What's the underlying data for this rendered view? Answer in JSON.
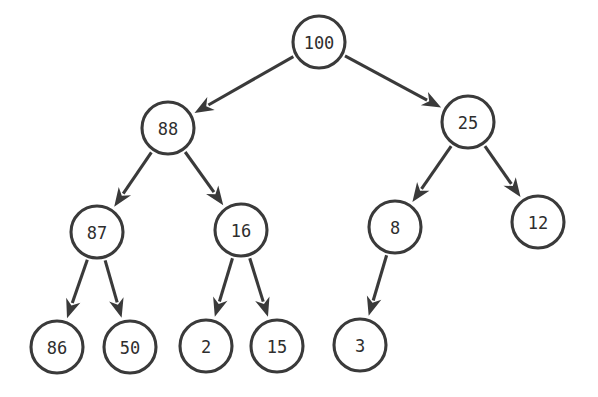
{
  "diagram": {
    "background_color": "#ffffff",
    "stroke_color": "#3a3a3a",
    "text_color": "#2e2e2e",
    "width": 598,
    "height": 397,
    "node_radius": 26,
    "nodes": [
      {
        "id": "n100",
        "label": "100",
        "cx": 319,
        "cy": 42,
        "r": 26
      },
      {
        "id": "n88",
        "label": "88",
        "cx": 168,
        "cy": 128,
        "r": 26
      },
      {
        "id": "n25",
        "label": "25",
        "cx": 468,
        "cy": 122,
        "r": 26
      },
      {
        "id": "n87",
        "label": "87",
        "cx": 97,
        "cy": 232,
        "r": 26
      },
      {
        "id": "n16",
        "label": "16",
        "cx": 241,
        "cy": 230,
        "r": 26
      },
      {
        "id": "n8",
        "label": "8",
        "cx": 395,
        "cy": 227,
        "r": 26
      },
      {
        "id": "n12",
        "label": "12",
        "cx": 538,
        "cy": 222,
        "r": 26
      },
      {
        "id": "n86",
        "label": "86",
        "cx": 57,
        "cy": 347,
        "r": 26
      },
      {
        "id": "n50",
        "label": "50",
        "cx": 130,
        "cy": 347,
        "r": 26
      },
      {
        "id": "n2",
        "label": "2",
        "cx": 206,
        "cy": 346,
        "r": 26
      },
      {
        "id": "n15",
        "label": "15",
        "cx": 277,
        "cy": 346,
        "r": 26
      },
      {
        "id": "n3",
        "label": "3",
        "cx": 360,
        "cy": 345,
        "r": 26
      }
    ],
    "edges": [
      {
        "id": "e-100-88",
        "from": "n100",
        "to": "n88",
        "from_label": "100",
        "to_label": "88"
      },
      {
        "id": "e-100-25",
        "from": "n100",
        "to": "n25",
        "from_label": "100",
        "to_label": "25"
      },
      {
        "id": "e-88-87",
        "from": "n88",
        "to": "n87",
        "from_label": "88",
        "to_label": "87"
      },
      {
        "id": "e-88-16",
        "from": "n88",
        "to": "n16",
        "from_label": "88",
        "to_label": "16"
      },
      {
        "id": "e-25-8",
        "from": "n25",
        "to": "n8",
        "from_label": "25",
        "to_label": "8"
      },
      {
        "id": "e-25-12",
        "from": "n25",
        "to": "n12",
        "from_label": "25",
        "to_label": "12"
      },
      {
        "id": "e-87-86",
        "from": "n87",
        "to": "n86",
        "from_label": "87",
        "to_label": "86"
      },
      {
        "id": "e-87-50",
        "from": "n87",
        "to": "n50",
        "from_label": "87",
        "to_label": "50"
      },
      {
        "id": "e-16-2",
        "from": "n16",
        "to": "n2",
        "from_label": "16",
        "to_label": "2"
      },
      {
        "id": "e-16-15",
        "from": "n16",
        "to": "n15",
        "from_label": "16",
        "to_label": "15"
      },
      {
        "id": "e-8-3",
        "from": "n8",
        "to": "n3",
        "from_label": "8",
        "to_label": "3"
      }
    ]
  }
}
